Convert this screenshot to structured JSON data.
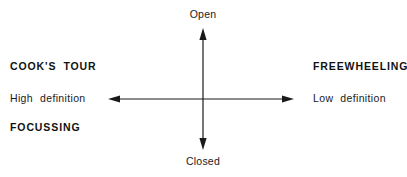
{
  "diagram": {
    "title_visible": false,
    "background_color": "#ffffff",
    "line_color": "#1a1a1a",
    "axes": {
      "vertical": {
        "name": "open-closed-axis",
        "top_label": "Open",
        "bottom_label": "Closed",
        "x": 203,
        "y_top": 28,
        "y_bottom": 150,
        "arrowheads": [
          "up",
          "down"
        ]
      },
      "horizontal": {
        "name": "definition-axis",
        "left_label": "High definition",
        "right_label": "Low definition",
        "y": 99,
        "x_left": 108,
        "x_right": 294,
        "arrowheads": [
          "left",
          "right"
        ]
      },
      "origin": {
        "x": 203,
        "y": 99
      }
    },
    "labels": {
      "open": "Open",
      "closed": "Closed",
      "cooks_tour_word1": "COOK'S",
      "cooks_tour_word2": "TOUR",
      "high_definition_word1": "High",
      "high_definition_word2": "definition",
      "focussing": "FOCUSSING",
      "freewheeling": "FREEWHEELING",
      "low_definition_word1": "Low",
      "low_definition_word2": "definition"
    },
    "left_group": [
      "COOK'S TOUR",
      "High definition",
      "FOCUSSING"
    ],
    "right_group": [
      "FREEWHEELING",
      "Low definition"
    ]
  }
}
